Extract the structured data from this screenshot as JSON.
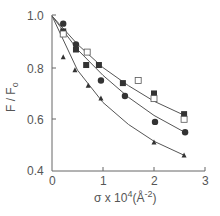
{
  "chart_data": {
    "type": "scatter",
    "title": "",
    "xlabel": "σ x 10⁴ (Å⁻²)",
    "ylabel": "F / F₀",
    "xlim": [
      0,
      3
    ],
    "ylim": [
      0.4,
      1.0
    ],
    "x_ticks": [
      "0",
      "1",
      "2",
      "3"
    ],
    "y_ticks": [
      "0.4",
      "0.6",
      "0.8",
      "1.0"
    ],
    "grid": false,
    "legend": "none",
    "series": [
      {
        "name": "filled-circle",
        "marker": "circle-filled",
        "points": [
          [
            0.22,
            0.97
          ],
          [
            0.47,
            0.89
          ],
          [
            0.96,
            0.75
          ],
          [
            1.43,
            0.69
          ],
          [
            2.02,
            0.59
          ],
          [
            2.61,
            0.55
          ]
        ]
      },
      {
        "name": "filled-square",
        "marker": "square-filled",
        "points": [
          [
            0.22,
            0.94
          ],
          [
            0.47,
            0.87
          ],
          [
            0.67,
            0.81
          ],
          [
            0.92,
            0.81
          ],
          [
            1.39,
            0.74
          ],
          [
            2.0,
            0.7
          ],
          [
            2.59,
            0.62
          ]
        ]
      },
      {
        "name": "open-square",
        "marker": "square-open",
        "points": [
          [
            0.22,
            0.93
          ],
          [
            0.69,
            0.86
          ],
          [
            1.69,
            0.75
          ],
          [
            2.0,
            0.68
          ],
          [
            2.59,
            0.6
          ]
        ]
      },
      {
        "name": "filled-triangle",
        "marker": "triangle-filled",
        "points": [
          [
            0.22,
            0.84
          ],
          [
            0.45,
            0.79
          ],
          [
            0.71,
            0.73
          ],
          [
            0.96,
            0.68
          ],
          [
            2.0,
            0.51
          ],
          [
            2.59,
            0.46
          ]
        ]
      }
    ],
    "fit_curves": [
      {
        "name": "upper-fit (squares)",
        "points": [
          [
            0,
            1.0
          ],
          [
            0.5,
            0.89
          ],
          [
            1.0,
            0.8
          ],
          [
            1.5,
            0.73
          ],
          [
            2.0,
            0.67
          ],
          [
            2.6,
            0.615
          ]
        ]
      },
      {
        "name": "middle-fit (circles)",
        "points": [
          [
            0,
            1.0
          ],
          [
            0.5,
            0.87
          ],
          [
            1.0,
            0.77
          ],
          [
            1.5,
            0.685
          ],
          [
            2.0,
            0.615
          ],
          [
            2.6,
            0.55
          ]
        ]
      },
      {
        "name": "lower-fit (triangles)",
        "points": [
          [
            0,
            1.0
          ],
          [
            0.5,
            0.79
          ],
          [
            1.0,
            0.665
          ],
          [
            1.5,
            0.58
          ],
          [
            2.0,
            0.515
          ],
          [
            2.6,
            0.46
          ]
        ]
      }
    ]
  },
  "labels": {
    "x_axis": "σ x 10",
    "x_axis_exp": "4",
    "x_axis_unit": "(Å",
    "x_axis_unit_exp": "-2",
    "x_axis_close": ")",
    "y_axis": "F / F",
    "y_axis_sub": "o",
    "tick_x0": "0",
    "tick_x1": "1",
    "tick_x2": "2",
    "tick_x3": "3",
    "tick_y04": "0.4",
    "tick_y06": "0.6",
    "tick_y08": "0.8",
    "tick_y10": "1.0"
  }
}
